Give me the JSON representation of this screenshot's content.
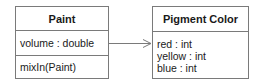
{
  "diagram": {
    "type": "uml-class-diagram",
    "classes": [
      {
        "id": "paint",
        "name": "Paint",
        "attributes": [
          "volume : double"
        ],
        "operations": [
          "mixIn(Paint)"
        ]
      },
      {
        "id": "pigment",
        "name": "Pigment Color",
        "attributes": [
          "red : int",
          "yellow : int",
          "blue : int"
        ],
        "operations": []
      }
    ],
    "relationships": [
      {
        "from": "Paint",
        "to": "Pigment Color",
        "kind": "directed-association",
        "arrowhead": "open"
      }
    ],
    "colors": {
      "border": "#7a7a7a",
      "text": "#1a1a1a",
      "background": "#ffffff"
    }
  }
}
